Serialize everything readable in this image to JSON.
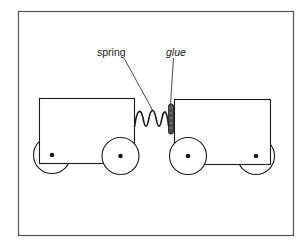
{
  "diagram": {
    "type": "physics-illustration",
    "labels": {
      "spring": "spring",
      "glue": "glue"
    },
    "colors": {
      "line": "#1a1a1a",
      "frame": "#555555",
      "background": "#ffffff",
      "glue": "#4a4a4a"
    },
    "objects": [
      {
        "id": "left-cart",
        "wheels": 2
      },
      {
        "id": "right-cart",
        "wheels": 2
      },
      {
        "id": "spring",
        "coils": 3
      },
      {
        "id": "glue"
      }
    ]
  }
}
